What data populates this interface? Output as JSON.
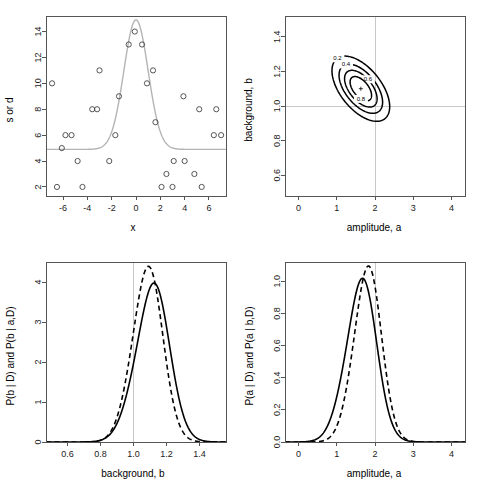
{
  "figure": {
    "name": "bayesian-parameter-estimation-figure",
    "panels": [
      "scatter-with-model",
      "joint-posterior-contours",
      "background-marginal",
      "amplitude-marginal"
    ]
  },
  "chart_data": [
    {
      "id": "panel-top-left",
      "type": "scatter",
      "title": "",
      "xlabel": "x",
      "ylabel": "s or d",
      "xlim": [
        -7.4,
        7.4
      ],
      "ylim": [
        1.3,
        15.2
      ],
      "xticks": [
        -6,
        -4,
        -2,
        0,
        2,
        4,
        6
      ],
      "xticklabels": [
        "-6",
        "-4",
        "-2",
        "0",
        "2",
        "4",
        "6"
      ],
      "yticks": [
        2,
        4,
        6,
        8,
        10,
        12,
        14
      ],
      "yticklabels": [
        "2",
        "4",
        "6",
        "8",
        "10",
        "12",
        "14"
      ],
      "grid": false,
      "legend": null,
      "points": [
        {
          "x": -6.9,
          "y": 10
        },
        {
          "x": -6.5,
          "y": 2
        },
        {
          "x": -6.1,
          "y": 5
        },
        {
          "x": -5.8,
          "y": 6
        },
        {
          "x": -5.3,
          "y": 6
        },
        {
          "x": -4.8,
          "y": 4
        },
        {
          "x": -4.4,
          "y": 2
        },
        {
          "x": -3.6,
          "y": 8
        },
        {
          "x": -3.2,
          "y": 8
        },
        {
          "x": -3.0,
          "y": 11
        },
        {
          "x": -2.2,
          "y": 4
        },
        {
          "x": -1.7,
          "y": 6
        },
        {
          "x": -1.4,
          "y": 9
        },
        {
          "x": -0.6,
          "y": 13
        },
        {
          "x": -0.1,
          "y": 14
        },
        {
          "x": 0.5,
          "y": 13
        },
        {
          "x": 0.9,
          "y": 10
        },
        {
          "x": 1.4,
          "y": 11
        },
        {
          "x": 1.6,
          "y": 7
        },
        {
          "x": 2.1,
          "y": 2
        },
        {
          "x": 2.5,
          "y": 3
        },
        {
          "x": 3.0,
          "y": 2
        },
        {
          "x": 3.1,
          "y": 4
        },
        {
          "x": 3.9,
          "y": 9
        },
        {
          "x": 4.0,
          "y": 4
        },
        {
          "x": 4.8,
          "y": 3
        },
        {
          "x": 5.2,
          "y": 8
        },
        {
          "x": 5.4,
          "y": 2
        },
        {
          "x": 6.4,
          "y": 6
        },
        {
          "x": 6.6,
          "y": 8
        },
        {
          "x": 7.0,
          "y": 6
        }
      ],
      "model_curve": {
        "name": "gaussian-plus-background",
        "amplitude": 10.0,
        "background": 4.9,
        "center": 0.0,
        "width": 1.0,
        "color": "#b4b4b4"
      }
    },
    {
      "id": "panel-top-right",
      "type": "contour",
      "title": "",
      "xlabel": "amplitude, a",
      "ylabel": "background, b",
      "xlim": [
        -0.35,
        4.35
      ],
      "ylim": [
        0.48,
        1.52
      ],
      "xticks": [
        0,
        1,
        2,
        3,
        4
      ],
      "xticklabels": [
        "0",
        "1",
        "2",
        "3",
        "4"
      ],
      "yticks": [
        0.6,
        0.8,
        1.0,
        1.2,
        1.4
      ],
      "yticklabels": [
        "0.6",
        "0.8",
        "1.0",
        "1.2",
        "1.4"
      ],
      "grid": false,
      "reference_lines": {
        "x": 2.0,
        "y": 1.0,
        "color": "#c8c8c8"
      },
      "peak": {
        "a": 1.63,
        "b": 1.1
      },
      "contour_levels": [
        0.2,
        0.4,
        0.6,
        0.8
      ],
      "contour_labels": [
        "0.2",
        "0.4",
        "0.6",
        "0.8"
      ],
      "correlation": -0.55
    },
    {
      "id": "panel-bottom-left",
      "type": "line",
      "title": "",
      "xlabel": "background, b",
      "ylabel": "P(b | D) and P(b | a,D)",
      "xlim": [
        0.47,
        1.56
      ],
      "ylim": [
        0,
        4.5
      ],
      "xticks": [
        0.6,
        0.8,
        1.0,
        1.2,
        1.4
      ],
      "xticklabels": [
        "0.6",
        "0.8",
        "1.0",
        "1.2",
        "1.4"
      ],
      "yticks": [
        0,
        1,
        2,
        3,
        4
      ],
      "yticklabels": [
        "0",
        "1",
        "2",
        "3",
        "4"
      ],
      "grid": false,
      "reference_lines": {
        "x": 1.0,
        "color": "#c8c8c8"
      },
      "series": [
        {
          "name": "P(b | D)",
          "style": "solid",
          "peak_x": 1.105,
          "peak_y": 3.9,
          "sigma": 0.102
        },
        {
          "name": "P(b | a,D)",
          "style": "dashed",
          "peak_x": 1.078,
          "peak_y": 4.35,
          "sigma": 0.092
        }
      ]
    },
    {
      "id": "panel-bottom-right",
      "type": "line",
      "title": "",
      "xlabel": "amplitude, a",
      "ylabel": "P(a | D) and P(a | b,D)",
      "xlim": [
        -0.35,
        4.35
      ],
      "ylim": [
        0,
        1.12
      ],
      "xticks": [
        0,
        1,
        2,
        3,
        4
      ],
      "xticklabels": [
        "0",
        "1",
        "2",
        "3",
        "4"
      ],
      "yticks": [
        0.0,
        0.2,
        0.4,
        0.6,
        0.8,
        1.0
      ],
      "yticklabels": [
        "0.0",
        "0.2",
        "0.4",
        "0.6",
        "0.8",
        "1.0"
      ],
      "grid": false,
      "reference_lines": {
        "x": 2.0,
        "color": "#c8c8c8"
      },
      "series": [
        {
          "name": "P(a | D)",
          "style": "solid",
          "peak_x": 1.6,
          "peak_y": 1.0,
          "sigma": 0.4
        },
        {
          "name": "P(a | b,D)",
          "style": "dashed",
          "peak_x": 1.78,
          "peak_y": 1.085,
          "sigma": 0.36
        }
      ]
    }
  ]
}
